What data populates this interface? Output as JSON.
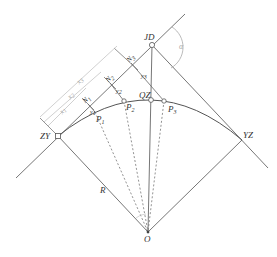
{
  "diagram": {
    "type": "circular-curve-offset-layout",
    "labels": {
      "JD": "JD",
      "alpha": "α",
      "QZ": "QZ",
      "ZY": "ZY",
      "YZ": "YZ",
      "O": "O",
      "R": "R",
      "P1": "P",
      "P1_sub": "1",
      "P2": "P",
      "P2_sub": "2",
      "P3": "P",
      "P3_sub": "3",
      "N1": "N",
      "N1_sub": "1",
      "N2": "N",
      "N2_sub": "2",
      "N3": "N",
      "N3_sub": "3",
      "y1": "y",
      "y1_sub": "1",
      "y2": "y",
      "y2_sub": "2",
      "y3": "y",
      "y3_sub": "3",
      "x1": "x",
      "x1_sub": "1",
      "x2": "x",
      "x2_sub": "2",
      "x3": "x",
      "x3_sub": "3"
    },
    "colors": {
      "line": "#555555",
      "dim": "#b0b0b0",
      "text": "#333333"
    }
  }
}
